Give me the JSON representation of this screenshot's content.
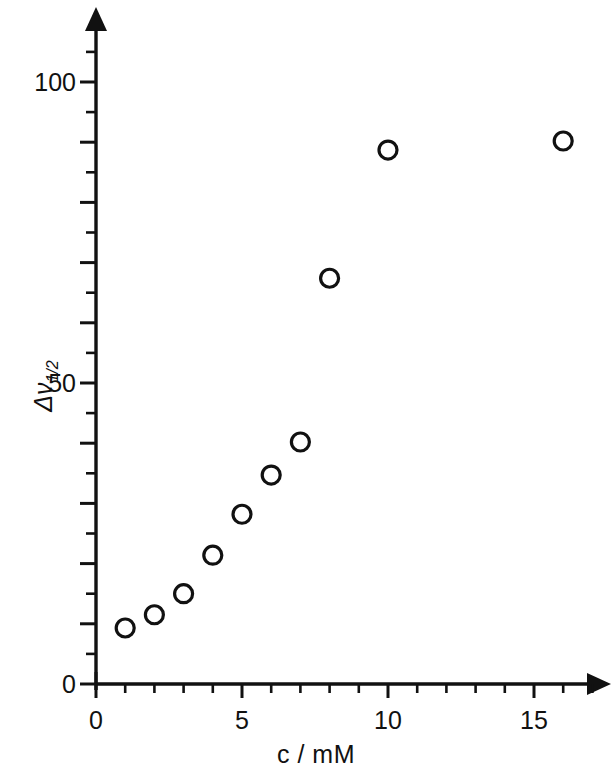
{
  "chart_data": {
    "type": "scatter",
    "title": "",
    "xlabel": "c / mM",
    "ylabel": "Δν1/2",
    "ylabel_main": "Δν",
    "ylabel_sub": "1/2",
    "xlim": [
      0,
      17.5
    ],
    "ylim": [
      0,
      107
    ],
    "grid": false,
    "legend": "none",
    "marker": "open-circle",
    "x": [
      1,
      2,
      3,
      4,
      5,
      6,
      7,
      8,
      10,
      16
    ],
    "y": [
      9.3,
      11.5,
      15.0,
      21.4,
      28.2,
      34.7,
      40.2,
      67.4,
      88.7,
      90.2
    ],
    "points": [
      {
        "x": 1,
        "y": 9.3
      },
      {
        "x": 2,
        "y": 11.5
      },
      {
        "x": 3,
        "y": 15.0
      },
      {
        "x": 4,
        "y": 21.4
      },
      {
        "x": 5,
        "y": 28.2
      },
      {
        "x": 6,
        "y": 34.7
      },
      {
        "x": 7,
        "y": 40.2
      },
      {
        "x": 8,
        "y": 67.4
      },
      {
        "x": 10,
        "y": 88.7
      },
      {
        "x": 16,
        "y": 90.2
      }
    ],
    "x_ticks": [
      0,
      1,
      2,
      3,
      4,
      5,
      6,
      7,
      8,
      9,
      10,
      11,
      12,
      13,
      14,
      15,
      16,
      17
    ],
    "x_tick_labels": [
      {
        "value": 0,
        "label": "0"
      },
      {
        "value": 5,
        "label": "5"
      },
      {
        "value": 10,
        "label": "10"
      },
      {
        "value": 15,
        "label": "15"
      }
    ],
    "y_ticks": [
      0,
      5,
      10,
      15,
      20,
      25,
      30,
      35,
      40,
      45,
      50,
      55,
      60,
      65,
      70,
      75,
      80,
      85,
      90,
      95,
      100,
      105
    ],
    "y_tick_labels": [
      {
        "value": 0,
        "label": "0"
      },
      {
        "value": 50,
        "label": "50"
      },
      {
        "value": 100,
        "label": "100"
      }
    ],
    "x_major_step": 5,
    "y_major_step": 10
  },
  "axes": {
    "x_title": "c / mM",
    "y_title_main": "Δν",
    "y_title_sub": "1/2",
    "arrow_x": "x-axis-arrow",
    "arrow_y": "y-axis-arrow"
  },
  "colors": {
    "ink": "#111111",
    "background": "#ffffff"
  }
}
